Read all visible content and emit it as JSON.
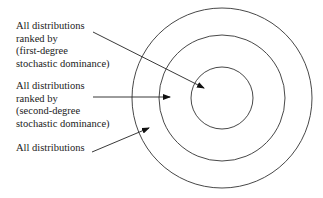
{
  "labels": {
    "first": [
      "All distributions",
      "ranked by",
      "(first-degree",
      "stochastic dominance)"
    ],
    "second": [
      "All distributions",
      "ranked by",
      "(second-degree",
      "stochastic dominance)"
    ],
    "all": [
      "All distributions"
    ]
  },
  "circles": [
    {
      "name": "outer-all",
      "r": 91
    },
    {
      "name": "middle-second-degree",
      "r": 64
    },
    {
      "name": "inner-first-degree",
      "r": 31
    }
  ]
}
